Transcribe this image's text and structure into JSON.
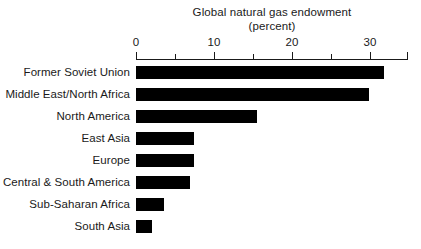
{
  "chart_data": {
    "type": "bar",
    "orientation": "horizontal",
    "title": "Global natural gas endowment",
    "subtitle": "(percent)",
    "xlabel": "",
    "ylabel": "",
    "xlim": [
      0,
      35
    ],
    "grid": false,
    "legend": null,
    "bar_color": "#000000",
    "axis_color": "#1a1a1a",
    "background": "#ffffff",
    "tick_labels": [
      "0",
      "10",
      "20",
      "30"
    ],
    "major_ticks": [
      0,
      10,
      20,
      30
    ],
    "minor_ticks": [
      5,
      15,
      25,
      35
    ],
    "categories": [
      "Former Soviet Union",
      "Middle East/North Africa",
      "North America",
      "East Asia",
      "Europe",
      "Central & South America",
      "Sub-Saharan Africa",
      "South Asia"
    ],
    "values": [
      31.9,
      30.0,
      15.6,
      7.4,
      7.4,
      7.0,
      3.6,
      2.0
    ],
    "bars": [
      {
        "label": "Former Soviet Union",
        "value": 31.9
      },
      {
        "label": "Middle East/North Africa",
        "value": 30.0
      },
      {
        "label": "North America",
        "value": 15.6
      },
      {
        "label": "East Asia",
        "value": 7.4
      },
      {
        "label": "Europe",
        "value": 7.4
      },
      {
        "label": "Central & South America",
        "value": 7.0
      },
      {
        "label": "Sub-Saharan Africa",
        "value": 3.6
      },
      {
        "label": "South Asia",
        "value": 2.0
      }
    ]
  }
}
